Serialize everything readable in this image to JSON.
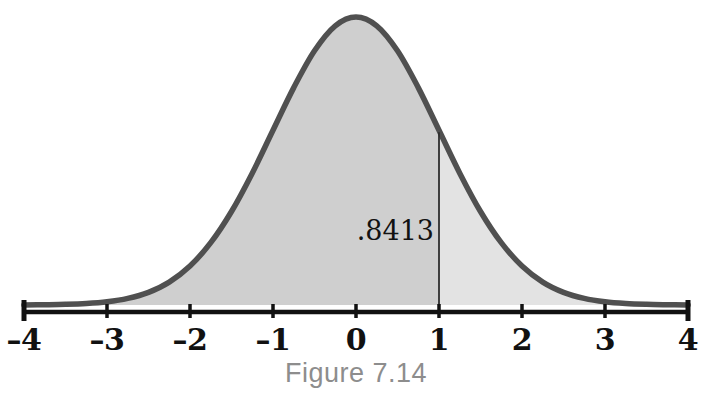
{
  "figure": {
    "caption": "Figure 7.14",
    "background_color": "#ffffff",
    "caption_color": "#8d8d8d"
  },
  "annotation": {
    "area_label": ".8413",
    "label_color": "#121212",
    "boundary_x_value": 1,
    "divider_line_color": "#2e2e2e"
  },
  "axis": {
    "line_color": "#111111",
    "tick_labels": [
      "–4",
      "–3",
      "–2",
      "–1",
      "0",
      "1",
      "2",
      "3",
      "4"
    ],
    "tick_values": [
      -4,
      -3,
      -2,
      -1,
      0,
      1,
      2,
      3,
      4
    ],
    "label_color": "#111111"
  },
  "style": {
    "curve_stroke_color": "#505050",
    "curve_stroke_width": 5.5,
    "fill_left_color": "#cfcfcf",
    "fill_right_color": "#e3e3e3"
  },
  "chart_data": {
    "type": "area",
    "title": "Figure 7.14",
    "subtitle": "",
    "xlabel": "",
    "ylabel": "",
    "xlim": [
      -4,
      4
    ],
    "ylim": [
      0,
      0.4
    ],
    "grid": false,
    "legend": "none",
    "distribution": "standard normal (mean 0, sd 1)",
    "x": [
      -4,
      -3.75,
      -3.5,
      -3.25,
      -3,
      -2.75,
      -2.5,
      -2.25,
      -2,
      -1.75,
      -1.5,
      -1.25,
      -1,
      -0.75,
      -0.5,
      -0.25,
      0,
      0.25,
      0.5,
      0.75,
      1,
      1.25,
      1.5,
      1.75,
      2,
      2.25,
      2.5,
      2.75,
      3,
      3.25,
      3.5,
      3.75,
      4
    ],
    "y": [
      0.0001,
      0.0004,
      0.0009,
      0.002,
      0.0044,
      0.0091,
      0.0175,
      0.0317,
      0.054,
      0.0863,
      0.1295,
      0.1826,
      0.242,
      0.3011,
      0.3521,
      0.3867,
      0.3989,
      0.3867,
      0.3521,
      0.3011,
      0.242,
      0.1826,
      0.1295,
      0.0863,
      0.054,
      0.0317,
      0.0175,
      0.0091,
      0.0044,
      0.002,
      0.0009,
      0.0004,
      0.0001
    ],
    "shaded_regions": [
      {
        "name": "cumulative-area-below-1",
        "from": -4,
        "to": 1,
        "value": 0.8413,
        "label": ".8413",
        "color": "#cfcfcf"
      },
      {
        "name": "upper-tail-above-1",
        "from": 1,
        "to": 4,
        "value": 0.1587,
        "label": "",
        "color": "#e3e3e3"
      }
    ],
    "annotations": [
      {
        "text": ".8413",
        "x": 1,
        "y": 0.19,
        "align": "right"
      }
    ]
  },
  "geometry": {
    "x_pixel_min": 24,
    "x_pixel_max": 688,
    "baseline_y": 305,
    "axis_y": 312,
    "peak_y": 17
  }
}
